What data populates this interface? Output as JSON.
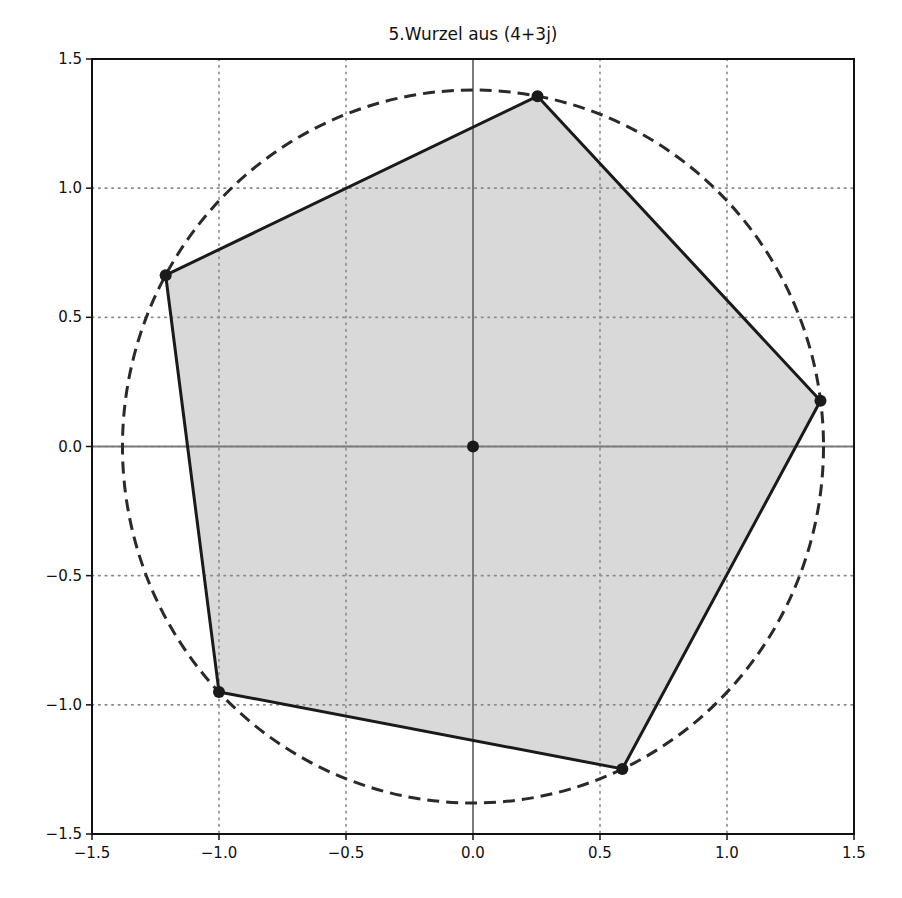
{
  "chart_data": {
    "type": "scatter",
    "title": "5.Wurzel aus (4+3j)",
    "xlabel": "",
    "ylabel": "",
    "xlim": [
      -1.5,
      1.5
    ],
    "ylim": [
      -1.5,
      1.5
    ],
    "grid": true,
    "legend": null,
    "x_ticks": [
      -1.5,
      -1.0,
      -0.5,
      0.0,
      0.5,
      1.0,
      1.5
    ],
    "x_tick_labels": [
      "−1.5",
      "−1.0",
      "−0.5",
      "0.0",
      "0.5",
      "1.0",
      "1.5"
    ],
    "y_ticks": [
      -1.5,
      -1.0,
      -0.5,
      0.0,
      0.5,
      1.0,
      1.5
    ],
    "y_tick_labels": [
      "−1.5",
      "−1.0",
      "−0.5",
      "0.0",
      "0.5",
      "1.0",
      "1.5"
    ],
    "circle": {
      "center": [
        0,
        0
      ],
      "radius": 1.38,
      "style": "dashed"
    },
    "origin_point": [
      0.0,
      0.0
    ],
    "series": [
      {
        "name": "roots",
        "style": "filled polygon with vertex markers",
        "points": [
          {
            "x": 1.368,
            "y": 0.177
          },
          {
            "x": 0.254,
            "y": 1.356
          },
          {
            "x": -1.21,
            "y": 0.663
          },
          {
            "x": -1.0,
            "y": -0.95
          },
          {
            "x": 0.588,
            "y": -1.248
          }
        ]
      }
    ]
  },
  "colors": {
    "fill": "#d9d9d9",
    "polygon_edge": "#1a1a1a",
    "marker": "#1a1a1a",
    "circle": "#2a2a2a",
    "grid": "#8a8a8a",
    "axis_lines": "#7a7a7a",
    "frame": "#111111"
  }
}
